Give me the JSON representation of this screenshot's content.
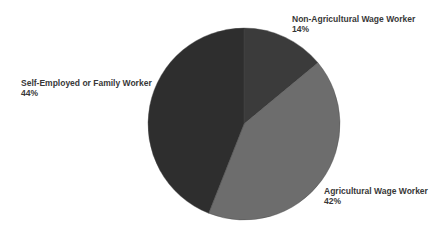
{
  "chart_data": {
    "type": "pie",
    "title": "",
    "start_angle_deg": 0,
    "direction": "clockwise",
    "categories": [
      "Non-Agricultural Wage Worker",
      "Agricultural Wage Worker",
      "Self-Employed or Family Worker"
    ],
    "values": [
      14,
      42,
      44
    ],
    "value_labels": [
      "14%",
      "42%",
      "44%"
    ],
    "colors": [
      "#3b3b3b",
      "#6d6d6d",
      "#2e2e2e"
    ],
    "legend": "none",
    "labels_outside": true
  },
  "labels": {
    "non_ag": {
      "name": "Non-Agricultural Wage Worker",
      "pct": "14%"
    },
    "ag": {
      "name": "Agricultural Wage Worker",
      "pct": "42%"
    },
    "self": {
      "name": "Self-Employed or Family Worker",
      "pct": "44%"
    }
  }
}
